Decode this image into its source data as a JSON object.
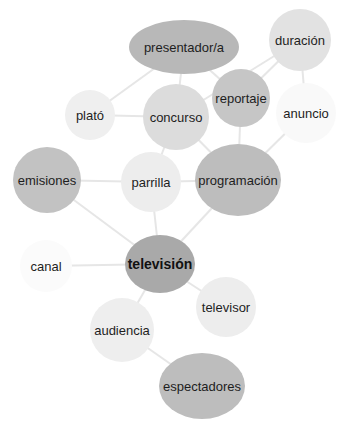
{
  "nodes": [
    {
      "id": "presentador",
      "label": "presentador/a",
      "cx": 184,
      "cy": 47,
      "rx": 55,
      "ry": 27,
      "fill": "#b8b8b8"
    },
    {
      "id": "duracion",
      "label": "duración",
      "cx": 300,
      "cy": 40,
      "rx": 31,
      "ry": 31,
      "fill": "#e2e2e2"
    },
    {
      "id": "reportaje",
      "label": "reportaje",
      "cx": 241,
      "cy": 98,
      "rx": 29,
      "ry": 29,
      "fill": "#c6c6c6"
    },
    {
      "id": "plato",
      "label": "plató",
      "cx": 90,
      "cy": 115,
      "rx": 25,
      "ry": 25,
      "fill": "#efefef"
    },
    {
      "id": "concurso",
      "label": "concurso",
      "cx": 176,
      "cy": 117,
      "rx": 33,
      "ry": 33,
      "fill": "#dcdcdc"
    },
    {
      "id": "anuncio",
      "label": "anuncio",
      "cx": 306,
      "cy": 113,
      "rx": 30,
      "ry": 30,
      "fill": "#f9f9f9"
    },
    {
      "id": "emisiones",
      "label": "emisiones",
      "cx": 47,
      "cy": 180,
      "rx": 34,
      "ry": 33,
      "fill": "#c2c2c2"
    },
    {
      "id": "parrilla",
      "label": "parrilla",
      "cx": 151,
      "cy": 182,
      "rx": 30,
      "ry": 30,
      "fill": "#ededed"
    },
    {
      "id": "programacion",
      "label": "programación",
      "cx": 238,
      "cy": 180,
      "rx": 43,
      "ry": 36,
      "fill": "#bdbdbd"
    },
    {
      "id": "canal",
      "label": "canal",
      "cx": 46,
      "cy": 266,
      "rx": 26,
      "ry": 26,
      "fill": "#fbfbfb"
    },
    {
      "id": "television",
      "label": "televisión",
      "cx": 160,
      "cy": 264,
      "rx": 35,
      "ry": 29,
      "fill": "#a9a9a9",
      "bold": true
    },
    {
      "id": "televisor",
      "label": "televisor",
      "cx": 226,
      "cy": 307,
      "rx": 30,
      "ry": 30,
      "fill": "#ededed"
    },
    {
      "id": "audiencia",
      "label": "audiencia",
      "cx": 122,
      "cy": 330,
      "rx": 32,
      "ry": 32,
      "fill": "#eeeeee"
    },
    {
      "id": "espectadores",
      "label": "espectadores",
      "cx": 202,
      "cy": 386,
      "rx": 43,
      "ry": 33,
      "fill": "#bdbdbd"
    }
  ],
  "edges": [
    [
      "presentador",
      "plato"
    ],
    [
      "presentador",
      "concurso"
    ],
    [
      "presentador",
      "reportaje"
    ],
    [
      "duracion",
      "concurso"
    ],
    [
      "duracion",
      "reportaje"
    ],
    [
      "duracion",
      "anuncio"
    ],
    [
      "plato",
      "concurso"
    ],
    [
      "concurso",
      "parrilla"
    ],
    [
      "concurso",
      "programacion"
    ],
    [
      "reportaje",
      "programacion"
    ],
    [
      "anuncio",
      "programacion"
    ],
    [
      "emisiones",
      "parrilla"
    ],
    [
      "parrilla",
      "programacion"
    ],
    [
      "emisiones",
      "television"
    ],
    [
      "parrilla",
      "television"
    ],
    [
      "programacion",
      "television"
    ],
    [
      "canal",
      "television"
    ],
    [
      "television",
      "televisor"
    ],
    [
      "television",
      "audiencia"
    ],
    [
      "audiencia",
      "espectadores"
    ]
  ]
}
